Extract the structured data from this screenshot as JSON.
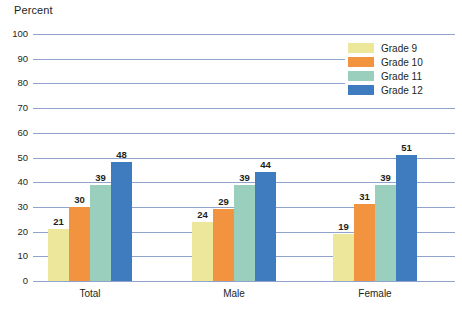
{
  "chart_data": {
    "type": "bar",
    "title": "",
    "subtitle": "",
    "xlabel": "",
    "ylabel": "Percent",
    "ylim": [
      0,
      100
    ],
    "ytick_step": 10,
    "yticks": [
      "100",
      "90",
      "80",
      "70",
      "60",
      "50",
      "40",
      "30",
      "20",
      "10",
      "0"
    ],
    "grid": true,
    "legend_position": "top-right",
    "categories": [
      "Total",
      "Male",
      "Female"
    ],
    "series": [
      {
        "name": "Grade 9",
        "color": "#ece79a",
        "values": [
          21,
          24,
          19
        ]
      },
      {
        "name": "Grade 10",
        "color": "#f2943f",
        "values": [
          30,
          29,
          31
        ]
      },
      {
        "name": "Grade 11",
        "color": "#9bcfbd",
        "values": [
          39,
          39,
          39
        ]
      },
      {
        "name": "Grade 12",
        "color": "#3f7cbf",
        "values": [
          48,
          44,
          51
        ]
      }
    ],
    "colors": {
      "grade_9": "#ece79a",
      "grade_10": "#f2943f",
      "grade_11": "#9bcfbd",
      "grade_12": "#3f7cbf",
      "gridline": "#8fa3cc",
      "text": "#231f20",
      "background": "#ffffff"
    }
  }
}
